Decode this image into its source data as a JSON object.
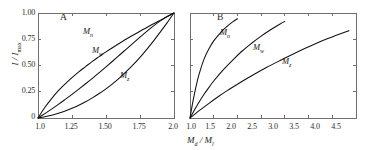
{
  "figure": {
    "background_color": "#ffffff",
    "axis_color": "#6f6f6f",
    "curve_color": "#111111"
  },
  "chart_data": {
    "type": "line",
    "title": "",
    "subtitle": "",
    "ylabel": "I / I",
    "ylabel_sub": "max",
    "xlabel": "M",
    "xlabel_sub_1": "d",
    "xlabel_mid": " / M",
    "xlabel_sub_2": "l",
    "grid": false,
    "legend_position": "inline-curve-labels",
    "panels": [
      {
        "letter": "A",
        "xlim": [
          1.0,
          2.0
        ],
        "ylim": [
          0.0,
          1.0
        ],
        "xticks": [
          1.0,
          1.25,
          1.5,
          1.75,
          2.0
        ],
        "xticklabels": [
          "1.0",
          "1.25",
          "1.50",
          "1.75",
          "2.0"
        ],
        "yticks": [
          0.0,
          0.25,
          0.5,
          0.75,
          1.0
        ],
        "yticklabels": [
          "0",
          "0.25",
          "0.50",
          "0.75",
          "1.00"
        ],
        "series": [
          {
            "name": "Mn",
            "label": "M",
            "label_sub": "n",
            "x": [
              1.0,
              1.05,
              1.1,
              1.15,
              1.2,
              1.25,
              1.3,
              1.35,
              1.4,
              1.45,
              1.5,
              1.55,
              1.6,
              1.65,
              1.7,
              1.75,
              1.8,
              1.85,
              1.9,
              1.95,
              2.0
            ],
            "values": [
              0.0,
              0.1,
              0.185,
              0.26,
              0.325,
              0.385,
              0.44,
              0.49,
              0.54,
              0.585,
              0.63,
              0.672,
              0.712,
              0.752,
              0.79,
              0.827,
              0.862,
              0.898,
              0.932,
              0.966,
              1.0
            ]
          },
          {
            "name": "Mw",
            "label": "M",
            "label_sub": "w",
            "x": [
              1.0,
              1.05,
              1.1,
              1.15,
              1.2,
              1.25,
              1.3,
              1.35,
              1.4,
              1.45,
              1.5,
              1.55,
              1.6,
              1.65,
              1.7,
              1.75,
              1.8,
              1.85,
              1.9,
              1.95,
              2.0
            ],
            "values": [
              0.0,
              0.042,
              0.085,
              0.13,
              0.177,
              0.225,
              0.275,
              0.326,
              0.378,
              0.432,
              0.487,
              0.543,
              0.6,
              0.657,
              0.714,
              0.77,
              0.825,
              0.878,
              0.925,
              0.966,
              1.0
            ]
          },
          {
            "name": "Mz",
            "label": "M",
            "label_sub": "z",
            "x": [
              1.0,
              1.05,
              1.1,
              1.15,
              1.2,
              1.25,
              1.3,
              1.35,
              1.4,
              1.45,
              1.5,
              1.55,
              1.6,
              1.65,
              1.7,
              1.75,
              1.8,
              1.85,
              1.9,
              1.95,
              2.0
            ],
            "values": [
              0.0,
              0.012,
              0.027,
              0.045,
              0.067,
              0.093,
              0.122,
              0.155,
              0.192,
              0.233,
              0.278,
              0.328,
              0.383,
              0.443,
              0.508,
              0.578,
              0.654,
              0.735,
              0.82,
              0.908,
              1.0
            ]
          }
        ]
      },
      {
        "letter": "B",
        "xlim": [
          1.0,
          4.5
        ],
        "ylim": [
          0.0,
          1.0
        ],
        "xticks": [
          1.0,
          1.5,
          2.0,
          2.5,
          3.0,
          3.5,
          4.0,
          4.5
        ],
        "xticklabels": [
          "1.0",
          "1.5",
          "2.0",
          "2.5",
          "3.0",
          "3.5",
          "4.0",
          "4.5"
        ],
        "yticks": [
          0.0,
          0.25,
          0.5,
          0.75,
          1.0
        ],
        "yticklabels": [
          "",
          "",
          "",
          "",
          ""
        ],
        "series": [
          {
            "name": "Mn",
            "label": "M",
            "label_sub": "n",
            "x": [
              1.0,
              1.05,
              1.1,
              1.15,
              1.2,
              1.3,
              1.4,
              1.5,
              1.6,
              1.7,
              1.8,
              1.9,
              2.0
            ],
            "values": [
              0.0,
              0.13,
              0.245,
              0.345,
              0.43,
              0.565,
              0.66,
              0.735,
              0.79,
              0.84,
              0.88,
              0.915,
              0.945
            ]
          },
          {
            "name": "Mw",
            "label": "M",
            "label_sub": "w",
            "x": [
              1.0,
              1.1,
              1.2,
              1.3,
              1.4,
              1.5,
              1.7,
              1.9,
              2.1,
              2.3,
              2.5,
              2.7,
              2.9,
              3.0
            ],
            "values": [
              0.0,
              0.082,
              0.158,
              0.228,
              0.292,
              0.352,
              0.458,
              0.552,
              0.638,
              0.712,
              0.78,
              0.84,
              0.895,
              0.92
            ]
          },
          {
            "name": "Mz",
            "label": "M",
            "label_sub": "z",
            "x": [
              1.0,
              1.2,
              1.4,
              1.6,
              1.8,
              2.0,
              2.3,
              2.6,
              2.9,
              3.2,
              3.5,
              3.8,
              4.1,
              4.35
            ],
            "values": [
              0.0,
              0.072,
              0.14,
              0.205,
              0.265,
              0.322,
              0.402,
              0.478,
              0.548,
              0.615,
              0.678,
              0.738,
              0.79,
              0.832
            ]
          }
        ]
      }
    ]
  }
}
